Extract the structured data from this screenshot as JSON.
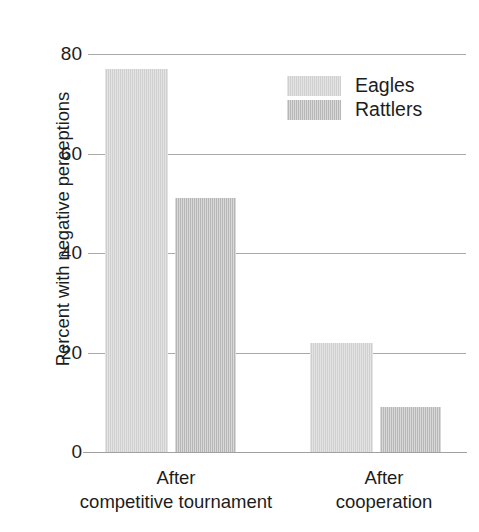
{
  "chart_data": {
    "type": "bar",
    "title": "",
    "xlabel": "",
    "ylabel": "Percent with negative perceptions",
    "ylim": [
      0,
      80
    ],
    "yticks": [
      0,
      20,
      40,
      60,
      80
    ],
    "ytick_labels": [
      "0",
      "20",
      "40",
      "60",
      "80"
    ],
    "grid": true,
    "legend_position": "top-right",
    "categories": [
      "After competitive tournament",
      "After cooperation"
    ],
    "category_lines": [
      {
        "line1": "After",
        "line2": "competitive tournament"
      },
      {
        "line1": "After",
        "line2": "cooperation"
      }
    ],
    "series": [
      {
        "name": "Eagles",
        "color": "#d2d2d2",
        "values": [
          77,
          22
        ]
      },
      {
        "name": "Rattlers",
        "color": "#bdbdbd",
        "values": [
          51,
          9
        ]
      }
    ]
  },
  "legend": {
    "items": [
      {
        "label": "Eagles",
        "color": "#d2d2d2"
      },
      {
        "label": "Rattlers",
        "color": "#bdbdbd"
      }
    ]
  },
  "axis": {
    "y_title": "Percent with negative perceptions",
    "ticks": [
      "80",
      "60",
      "40",
      "20",
      "0"
    ]
  },
  "colors": {
    "eagles": "#d2d2d2",
    "rattlers": "#bdbdbd",
    "gridline": "#a9a9a9",
    "text": "#1d1d1d",
    "background": "#ffffff"
  }
}
